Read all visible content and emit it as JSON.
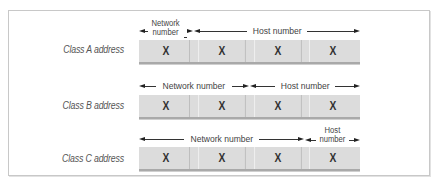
{
  "diagram": {
    "rows": [
      {
        "label": "Class A address",
        "octets": [
          "X",
          "X",
          "X",
          "X"
        ],
        "spans": [
          {
            "label_line1": "Network",
            "label_line2": "number",
            "octets": 1
          },
          {
            "label": "Host number",
            "octets": 3
          }
        ]
      },
      {
        "label": "Class B address",
        "octets": [
          "X",
          "X",
          "X",
          "X"
        ],
        "spans": [
          {
            "label": "Network number",
            "octets": 2
          },
          {
            "label": "Host number",
            "octets": 2
          }
        ]
      },
      {
        "label": "Class C address",
        "octets": [
          "X",
          "X",
          "X",
          "X"
        ],
        "spans": [
          {
            "label": "Network number",
            "octets": 3
          },
          {
            "label_line1": "Host",
            "label_line2": "number",
            "octets": 1
          }
        ]
      }
    ],
    "colors": {
      "frame_border": "#c8c8c8",
      "octet_fill": "#dcdcdc",
      "octet_shadow": "#a9a9a9",
      "label_text": "#555555",
      "arrow": "#222222"
    }
  }
}
